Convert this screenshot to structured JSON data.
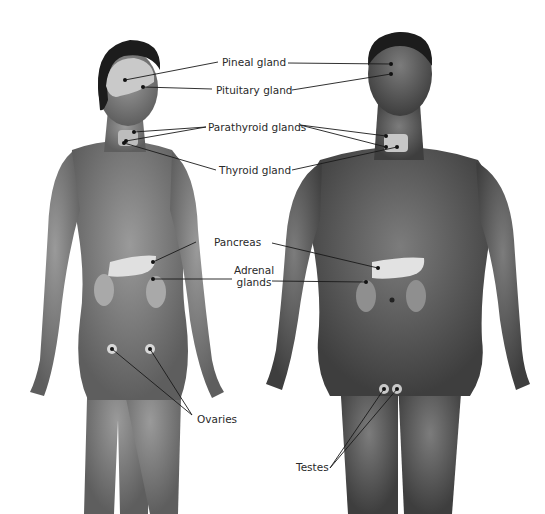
{
  "diagram": {
    "figures": [
      {
        "name": "female",
        "glands": [
          "Pineal gland",
          "Pituitary gland",
          "Parathyroid glands",
          "Thyroid gland",
          "Pancreas",
          "Adrenal glands",
          "Ovaries"
        ]
      },
      {
        "name": "male",
        "glands": [
          "Pineal gland",
          "Pituitary gland",
          "Parathyroid glands",
          "Thyroid gland",
          "Pancreas",
          "Adrenal glands",
          "Testes"
        ]
      }
    ],
    "colors": {
      "background": "#ffffff",
      "skin_female": "#8a8a8a",
      "skin_male": "#6b6b6b",
      "hair": "#1c1c1c",
      "organ_highlight": "#e6e6e6",
      "leader_line": "#1a1a1a",
      "label_text": "#2a2a2a"
    }
  },
  "labels": {
    "pineal": "Pineal gland",
    "pituitary": "Pituitary gland",
    "parathyroid": "Parathyroid glands",
    "thyroid": "Thyroid gland",
    "pancreas": "Pancreas",
    "adrenal_line1": "Adrenal",
    "adrenal_line2": "glands",
    "ovaries": "Ovaries",
    "testes": "Testes"
  }
}
